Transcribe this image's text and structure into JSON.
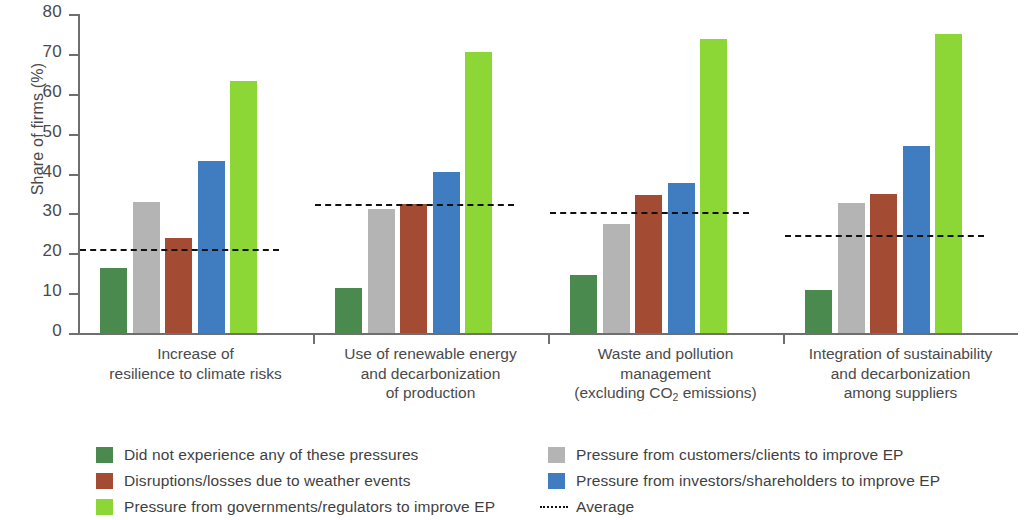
{
  "chart_data": {
    "type": "bar",
    "title": "",
    "subtitle": "",
    "xlabel": "",
    "ylabel": "Share of firms (%)",
    "ylim": [
      0,
      80
    ],
    "ytick_labels": [
      "80",
      "70",
      "60",
      "50",
      "40",
      "30",
      "20",
      "10",
      "0"
    ],
    "ytick_values": [
      80,
      70,
      60,
      50,
      40,
      30,
      20,
      10,
      0
    ],
    "grid": false,
    "legend_position": "bottom",
    "categories": [
      "Increase of resilience to climate risks",
      "Use of renewable energy and decarbonization of production",
      "Waste and pollution management (excluding CO2 emissions)",
      "Integration of sustainability and decarbonization among suppliers"
    ],
    "category_label_lines": [
      [
        "Increase of",
        "resilience to climate risks"
      ],
      [
        "Use of renewable energy",
        "and decarbonization",
        "of production"
      ],
      [
        "Waste and pollution",
        "management",
        "(excluding CO₂ emissions)"
      ],
      [
        "Integration of sustainability",
        "and decarbonization",
        "among suppliers"
      ]
    ],
    "series": [
      {
        "name": "Did not experience any of these pressures",
        "color": "#4a8a4f",
        "values": [
          16.3,
          11.3,
          14.6,
          10.8
        ]
      },
      {
        "name": "Pressure from customers/clients to improve EP",
        "color": "#b4b4b4",
        "values": [
          32.8,
          31.0,
          27.4,
          32.5
        ]
      },
      {
        "name": "Disruptions/losses due to weather events",
        "color": "#a34b33",
        "values": [
          23.8,
          32.3,
          34.5,
          34.8
        ]
      },
      {
        "name": "Pressure from investors/shareholders to improve EP",
        "color": "#3f7cc0",
        "values": [
          43.1,
          40.5,
          37.6,
          46.8
        ]
      },
      {
        "name": "Pressure from governments/regulators to improve EP",
        "color": "#8cd636",
        "values": [
          63.2,
          70.5,
          73.7,
          74.9
        ]
      }
    ],
    "average": {
      "name": "Average",
      "color": "#111111",
      "style": "dashed",
      "values": [
        21.0,
        32.3,
        30.4,
        24.6
      ]
    }
  },
  "legend": {
    "left_items": [
      {
        "label": "Did not experience any of these pressures",
        "color": "#4a8a4f",
        "marker": "square"
      },
      {
        "label": "Disruptions/losses due to weather events",
        "color": "#a34b33",
        "marker": "square"
      },
      {
        "label": "Pressure from governments/regulators to improve EP",
        "color": "#8cd636",
        "marker": "square"
      }
    ],
    "right_items": [
      {
        "label": "Pressure from customers/clients to improve EP",
        "color": "#b4b4b4",
        "marker": "square"
      },
      {
        "label": "Pressure from investors/shareholders to improve EP",
        "color": "#3f7cc0",
        "marker": "square"
      },
      {
        "label": "Average",
        "color": "#111111",
        "marker": "dashed-line"
      }
    ]
  }
}
